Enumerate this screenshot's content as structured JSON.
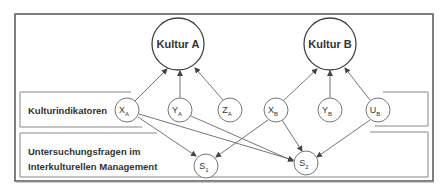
{
  "colors": {
    "frame": "#555555",
    "inner_box": "#888888",
    "edge": "#666666",
    "text": "#333333",
    "background": "#ffffff"
  },
  "culture_nodes": [
    {
      "id": "kultur_a",
      "label": "Kultur A"
    },
    {
      "id": "kultur_b",
      "label": "Kultur B"
    }
  ],
  "rows": {
    "indicators": {
      "label": "Kulturindikatoren"
    },
    "questions": {
      "line1": "Untersuchungsfragen im",
      "line2": "Interkulturellen Management"
    }
  },
  "indicator_nodes": [
    {
      "id": "xa",
      "main": "X",
      "sub": "A"
    },
    {
      "id": "ya",
      "main": "Y",
      "sub": "A"
    },
    {
      "id": "za",
      "main": "Z",
      "sub": "A"
    },
    {
      "id": "xb",
      "main": "X",
      "sub": "B"
    },
    {
      "id": "yb",
      "main": "Y",
      "sub": "B"
    },
    {
      "id": "ub",
      "main": "U",
      "sub": "B"
    }
  ],
  "question_nodes": [
    {
      "id": "s1",
      "main": "S",
      "sub": "1"
    },
    {
      "id": "s2",
      "main": "S",
      "sub": "2"
    }
  ],
  "edges": [
    {
      "from": "X_A",
      "to": "Kultur A"
    },
    {
      "from": "Y_A",
      "to": "Kultur A"
    },
    {
      "from": "Z_A",
      "to": "Kultur A"
    },
    {
      "from": "X_B",
      "to": "Kultur B"
    },
    {
      "from": "Y_B",
      "to": "Kultur B"
    },
    {
      "from": "U_B",
      "to": "Kultur B"
    },
    {
      "from": "X_A",
      "to": "S_1"
    },
    {
      "from": "X_A",
      "to": "S_2"
    },
    {
      "from": "Y_A",
      "to": "S_2"
    },
    {
      "from": "X_B",
      "to": "S_1"
    },
    {
      "from": "X_B",
      "to": "S_2"
    },
    {
      "from": "U_B",
      "to": "S_2"
    }
  ]
}
